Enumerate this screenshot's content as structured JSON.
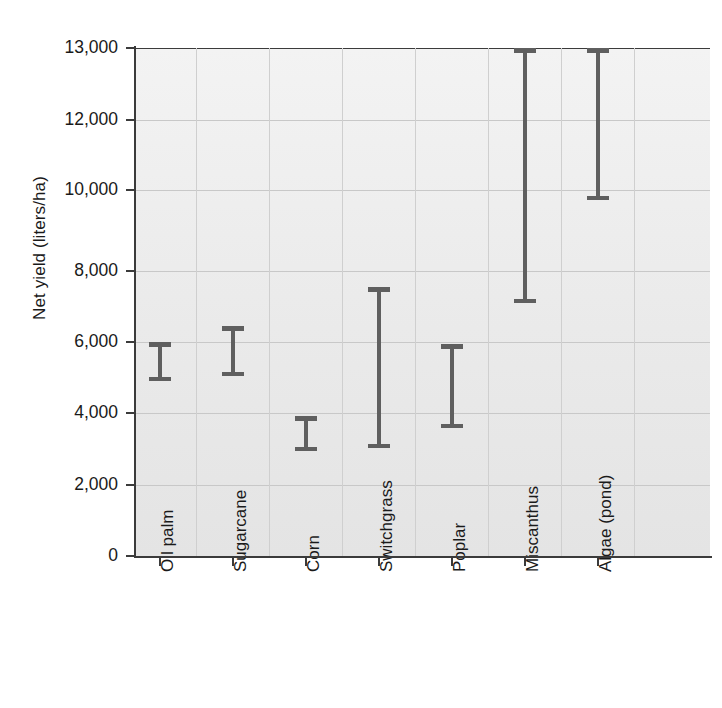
{
  "chart_data": {
    "type": "bar",
    "subtype": "range-interval",
    "title": "",
    "xlabel": "",
    "ylabel": "Net yield (liters/ha)",
    "categories": [
      "Oil palm",
      "Sugarcane",
      "Corn",
      "Switchgrass",
      "Poplar",
      "Miscanthus",
      "Algae (pond)"
    ],
    "series": [
      {
        "name": "low",
        "values": [
          4930,
          5200,
          3050,
          3020,
          3620,
          6950,
          9850
        ]
      },
      {
        "name": "high",
        "values": [
          5900,
          6400,
          3700,
          7450,
          5850,
          13000,
          13000
        ]
      }
    ],
    "ranges": [
      {
        "category": "Oil palm",
        "low": 4930,
        "high": 5900
      },
      {
        "category": "Sugarcane",
        "low": 5200,
        "high": 6400
      },
      {
        "category": "Corn",
        "low": 3050,
        "high": 3700
      },
      {
        "category": "Switchgrass",
        "low": 3020,
        "high": 7450
      },
      {
        "category": "Poplar",
        "low": 3620,
        "high": 5850
      },
      {
        "category": "Miscanthus",
        "low": 6950,
        "high": 13000
      },
      {
        "category": "Algae (pond)",
        "low": 9850,
        "high": 13000
      }
    ],
    "ylim": [
      0,
      13000
    ],
    "yticks": [
      0,
      2000,
      4000,
      6000,
      8000,
      10000,
      12000,
      13000
    ],
    "ytick_labels": [
      "0",
      "2,000",
      "4,000",
      "6,000",
      "8,000",
      "10,000",
      "12,000",
      "13,000"
    ],
    "y_axis_note": "non-linear top step: 12,000 to 13,000 occupies the same spacing as each 2,000 interval",
    "grid": true,
    "grid_orientation": "both",
    "legend": "none",
    "bar_color": "#5f5f5f",
    "plot_background": "#eeeeee",
    "axis_color": "#3b3b3b"
  },
  "axes": {
    "y_title": "Net yield (liters/ha)",
    "y_ticks": [
      {
        "label": "13,000",
        "value": 13000,
        "y": 48
      },
      {
        "label": "12,000",
        "value": 12000,
        "y": 120
      },
      {
        "label": "10,000",
        "value": 10000,
        "y": 190
      },
      {
        "label": "8,000",
        "value": 8000,
        "y": 271
      },
      {
        "label": "6,000",
        "value": 6000,
        "y": 342
      },
      {
        "label": "4,000",
        "value": 4000,
        "y": 413
      },
      {
        "label": "2,000",
        "value": 2000,
        "y": 485
      },
      {
        "label": "0",
        "value": 0,
        "y": 556
      }
    ],
    "x_ticks": [
      {
        "label": "Oil palm",
        "x": 160
      },
      {
        "label": "Sugarcane",
        "x": 233
      },
      {
        "label": "Corn",
        "x": 306
      },
      {
        "label": "Switchgrass",
        "x": 379
      },
      {
        "label": "Poplar",
        "x": 452
      },
      {
        "label": "Miscanthus",
        "x": 525
      },
      {
        "label": "Algae (pond)",
        "x": 598
      }
    ]
  },
  "bars": [
    {
      "name": "Oil palm",
      "x": 160,
      "top": 342,
      "bottom": 381
    },
    {
      "name": "Sugarcane",
      "x": 233,
      "top": 326,
      "bottom": 376
    },
    {
      "name": "Corn",
      "x": 306,
      "top": 416,
      "bottom": 451
    },
    {
      "name": "Switchgrass",
      "x": 379,
      "top": 287,
      "bottom": 448
    },
    {
      "name": "Poplar",
      "x": 452,
      "top": 344,
      "bottom": 428
    },
    {
      "name": "Miscanthus",
      "x": 525,
      "top": 48,
      "bottom": 303
    },
    {
      "name": "Algae (pond)",
      "x": 598,
      "top": 48,
      "bottom": 200
    }
  ],
  "gridlines_v_x": [
    196,
    269,
    342,
    415,
    488,
    561,
    634
  ]
}
